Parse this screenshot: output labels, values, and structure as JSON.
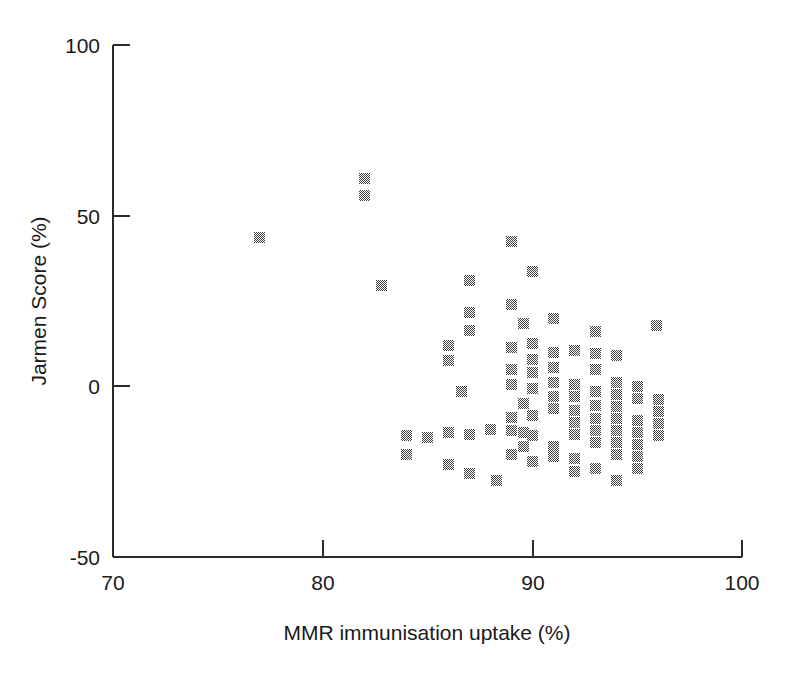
{
  "chart_data": {
    "type": "scatter",
    "title": "",
    "xlabel": "MMR immunisation uptake (%)",
    "ylabel": "Jarmen Score (%)",
    "xlim": [
      70,
      100
    ],
    "ylim": [
      -50,
      100
    ],
    "xticks": [
      70,
      80,
      90,
      100
    ],
    "yticks": [
      -50,
      0,
      50,
      100
    ],
    "xtick_labels": [
      "70",
      "80",
      "90",
      "100"
    ],
    "ytick_labels": [
      "-50",
      "0",
      "50",
      "100"
    ],
    "grid": false,
    "legend": null,
    "marker_style": "filled-dithered-square",
    "marker_color": "#4a4a4a",
    "series": [
      {
        "name": "practices",
        "points": [
          [
            77.0,
            43.5
          ],
          [
            82.0,
            61.0
          ],
          [
            82.0,
            56.0
          ],
          [
            82.8,
            29.6
          ],
          [
            84.0,
            -14.5
          ],
          [
            84.0,
            -20.0
          ],
          [
            85.0,
            -15.0
          ],
          [
            86.0,
            12.0
          ],
          [
            86.0,
            7.5
          ],
          [
            86.0,
            -13.5
          ],
          [
            86.0,
            -23.0
          ],
          [
            86.6,
            -1.5
          ],
          [
            87.0,
            31.0
          ],
          [
            87.0,
            21.5
          ],
          [
            87.0,
            16.5
          ],
          [
            87.0,
            -14.0
          ],
          [
            87.0,
            -25.5
          ],
          [
            88.0,
            -12.5
          ],
          [
            88.3,
            -27.5
          ],
          [
            89.0,
            42.5
          ],
          [
            89.0,
            24.0
          ],
          [
            89.0,
            11.5
          ],
          [
            89.0,
            5.0
          ],
          [
            89.0,
            0.5
          ],
          [
            89.0,
            -9.0
          ],
          [
            89.0,
            -13.0
          ],
          [
            89.0,
            -20.0
          ],
          [
            89.6,
            18.5
          ],
          [
            89.6,
            -5.0
          ],
          [
            89.6,
            -13.5
          ],
          [
            89.6,
            -17.5
          ],
          [
            90.0,
            33.5
          ],
          [
            90.0,
            12.5
          ],
          [
            90.0,
            8.0
          ],
          [
            90.0,
            4.0
          ],
          [
            90.0,
            -0.5
          ],
          [
            90.0,
            -8.5
          ],
          [
            90.0,
            -14.5
          ],
          [
            90.0,
            -22.0
          ],
          [
            91.0,
            20.0
          ],
          [
            91.0,
            10.0
          ],
          [
            91.0,
            5.5
          ],
          [
            91.0,
            1.0
          ],
          [
            91.0,
            -3.0
          ],
          [
            91.0,
            -6.5
          ],
          [
            91.0,
            -17.5
          ],
          [
            91.0,
            -20.5
          ],
          [
            92.0,
            10.5
          ],
          [
            92.0,
            0.5
          ],
          [
            92.0,
            -3.0
          ],
          [
            92.0,
            -7.0
          ],
          [
            92.0,
            -10.5
          ],
          [
            92.0,
            -14.0
          ],
          [
            92.0,
            -21.0
          ],
          [
            92.0,
            -25.0
          ],
          [
            93.0,
            16.0
          ],
          [
            93.0,
            9.5
          ],
          [
            93.0,
            5.0
          ],
          [
            93.0,
            -1.5
          ],
          [
            93.0,
            -5.5
          ],
          [
            93.0,
            -9.5
          ],
          [
            93.0,
            -13.0
          ],
          [
            93.0,
            -16.5
          ],
          [
            93.0,
            -24.0
          ],
          [
            94.0,
            9.0
          ],
          [
            94.0,
            1.0
          ],
          [
            94.0,
            -2.5
          ],
          [
            94.0,
            -6.0
          ],
          [
            94.0,
            -9.5
          ],
          [
            94.0,
            -13.0
          ],
          [
            94.0,
            -16.5
          ],
          [
            94.0,
            -20.0
          ],
          [
            94.0,
            -27.5
          ],
          [
            95.0,
            0.0
          ],
          [
            95.0,
            -3.5
          ],
          [
            95.0,
            -10.0
          ],
          [
            95.0,
            -13.5
          ],
          [
            95.0,
            -17.0
          ],
          [
            95.0,
            -20.5
          ],
          [
            95.0,
            -24.0
          ],
          [
            95.9,
            17.7
          ],
          [
            96.0,
            -4.0
          ],
          [
            96.0,
            -7.5
          ],
          [
            96.0,
            -11.0
          ],
          [
            96.0,
            -14.5
          ]
        ]
      }
    ]
  },
  "axes": {
    "x_title": "MMR immunisation uptake (%)",
    "y_title": "Jarmen Score (%)"
  }
}
